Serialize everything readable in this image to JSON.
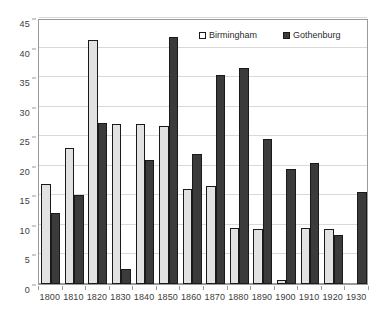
{
  "chart_data": {
    "type": "bar",
    "title": "",
    "subtitle": "",
    "xlabel": "",
    "ylabel": "",
    "ylim": [
      0,
      45
    ],
    "ytick_step": 5,
    "yticks": [
      0,
      5,
      10,
      15,
      20,
      25,
      30,
      35,
      40,
      45
    ],
    "grid": true,
    "grid_axis": "y",
    "legend_position": "top-center-inside",
    "categories": [
      "1800",
      "1810",
      "1820",
      "1830",
      "1840",
      "1850",
      "1860",
      "1870",
      "1880",
      "1890",
      "1900",
      "1910",
      "1920",
      "1930"
    ],
    "series": [
      {
        "name": "Birmingham",
        "color": "#e2e2e2",
        "values": [
          17.0,
          23.0,
          41.3,
          27.1,
          27.1,
          26.8,
          16.0,
          16.5,
          9.5,
          9.3,
          0.7,
          9.4,
          9.3,
          null
        ]
      },
      {
        "name": "Gothenburg",
        "color": "#3b3b3b",
        "values": [
          12.0,
          15.0,
          27.2,
          2.5,
          21.0,
          41.8,
          22.0,
          35.4,
          36.6,
          24.6,
          19.5,
          20.5,
          8.3,
          15.5
        ]
      }
    ]
  },
  "legend": {
    "items": [
      {
        "label": "Birmingham",
        "swatch": "light-square-swatch"
      },
      {
        "label": "Gothenburg",
        "swatch": "dark-square-swatch"
      }
    ]
  },
  "axes": {
    "y_tick_labels": [
      "0",
      "5",
      "10",
      "15",
      "20",
      "25",
      "30",
      "35",
      "40",
      "45"
    ],
    "x_tick_labels": [
      "1800",
      "1810",
      "1820",
      "1830",
      "1840",
      "1850",
      "1860",
      "1870",
      "1880",
      "1890",
      "1900",
      "1910",
      "1920",
      "1930"
    ]
  },
  "colors": {
    "background": "#ffffff",
    "frame": "#9a9a9a",
    "gridline": "#d9d9d9",
    "bar_outline": "#1a1a1a",
    "series_light": "#e2e2e2",
    "series_dark": "#3b3b3b",
    "tick_text": "#3c3c3c"
  }
}
